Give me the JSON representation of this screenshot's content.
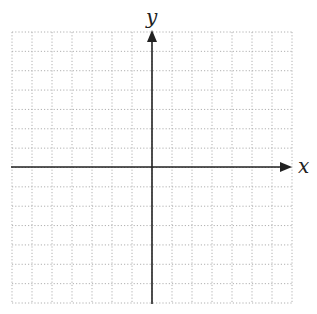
{
  "diagram": {
    "type": "coordinate-plane",
    "x_axis_label": "x",
    "y_axis_label": "y",
    "grid": {
      "columns": 14,
      "rows": 14,
      "left": 12,
      "top": 32,
      "right": 292,
      "bottom": 303,
      "line_style": "dotted",
      "line_color": "#b0b0b0"
    },
    "origin": {
      "x": 152,
      "y": 167
    },
    "axis_color": "#222222"
  }
}
